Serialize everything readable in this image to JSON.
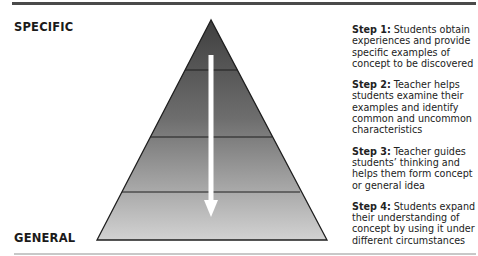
{
  "labels": {
    "top": "SPECIFIC",
    "bottom": "GENERAL"
  },
  "pyramid": {
    "levels": 4,
    "arrow_direction": "down",
    "colors": {
      "top": "#3f3f3f",
      "bottom": "#cfcfcf",
      "outline": "#1e1e1e",
      "arrow": "#ffffff"
    }
  },
  "steps": [
    {
      "title": "Step 1:",
      "text": "Students obtain experiences and provide specific examples of concept to be discovered"
    },
    {
      "title": "Step 2:",
      "text": "Teacher helps students examine their examples and identify common and uncommon characteristics"
    },
    {
      "title": "Step 3:",
      "text": "Teacher guides students’ thinking and helps them form concept or general idea"
    },
    {
      "title": "Step 4:",
      "text": "Students expand their understanding of concept by using it under different circumstances"
    }
  ]
}
